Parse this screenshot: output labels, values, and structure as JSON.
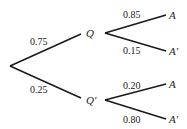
{
  "diagram": {
    "type": "probability-tree",
    "root": "",
    "level1": [
      {
        "node": "Q",
        "probability": "0.75",
        "children": [
          {
            "node": "A",
            "probability": "0.85"
          },
          {
            "node": "A′",
            "probability": "0.15"
          }
        ]
      },
      {
        "node": "Q′",
        "probability": "0.25",
        "children": [
          {
            "node": "A",
            "probability": "0.20"
          },
          {
            "node": "A′",
            "probability": "0.80"
          }
        ]
      }
    ]
  }
}
